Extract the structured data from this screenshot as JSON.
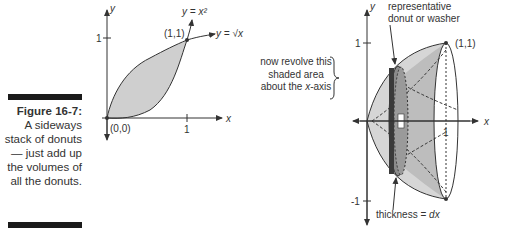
{
  "caption": {
    "figure_label": "Figure 16-7:",
    "text": "A sideways stack of donuts — just add up the volumes of all the donuts."
  },
  "left_graph": {
    "y_axis_label": "y",
    "x_axis_label": "x",
    "y_tick": "1",
    "x_tick": "1",
    "origin_label": "(0,0)",
    "point_label": "(1,1)",
    "curve_upper_label": "y = √x",
    "curve_lower_label": "y = x²"
  },
  "note": {
    "line1": "now revolve this",
    "line2": "shaded area",
    "line3_prefix": "about the ",
    "line3_var": "x",
    "line3_suffix": "-axis"
  },
  "right_graph": {
    "y_axis_label": "y",
    "x_axis_label": "x",
    "y_tick_top": "1",
    "y_tick_bottom": "-1",
    "x_tick": "1",
    "point_label": "(1,1)",
    "washer_label_line1": "representative",
    "washer_label_line2": "donut or washer",
    "thickness_label_prefix": "thickness = ",
    "thickness_label_var": "dx"
  },
  "colors": {
    "shade": "#cfcfcf",
    "shade_dark": "#a8a8a8",
    "washer": "#555555",
    "line": "#333333"
  }
}
